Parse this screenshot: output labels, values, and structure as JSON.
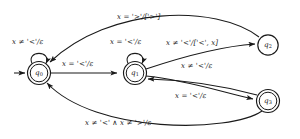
{
  "figure": {
    "kind": "finite-state-transducer-diagram",
    "background_color": "#ffffff",
    "stroke_color": "#1a1a1a",
    "width": 300,
    "height": 139
  },
  "states": [
    {
      "id": "q0",
      "label": "q",
      "subscript": "0",
      "accepting": true,
      "initial": true,
      "cx": 39,
      "cy": 73,
      "r_outer": 11.5,
      "r_inner": 8.8
    },
    {
      "id": "q1",
      "label": "q",
      "subscript": "1",
      "accepting": true,
      "initial": false,
      "cx": 135,
      "cy": 73,
      "r_outer": 11.5,
      "r_inner": 8.8
    },
    {
      "id": "q2",
      "label": "q",
      "subscript": "2",
      "accepting": false,
      "initial": false,
      "cx": 268,
      "cy": 45,
      "r_outer": 10.2,
      "r_inner": 0
    },
    {
      "id": "q3",
      "label": "q",
      "subscript": "3",
      "accepting": true,
      "initial": false,
      "cx": 268,
      "cy": 101,
      "r_outer": 11.5,
      "r_inner": 8.8
    }
  ],
  "transitions": [
    {
      "id": "t-q2-q0",
      "from": "q2",
      "to": "q0",
      "guard_var": "x",
      "guard_op": "=",
      "guard_value": "'>'",
      "output": "['>']",
      "label": "x = '>'/['>']",
      "label_x": 117,
      "label_y": 13
    },
    {
      "id": "t-q0-self",
      "from": "q0",
      "to": "q0",
      "guard_var": "x",
      "guard_op": "≠",
      "guard_value": "'<'",
      "output": "ε",
      "label": "x ≠ '<'/ε",
      "label_x": 12,
      "label_y": 38
    },
    {
      "id": "t-q0-q1",
      "from": "q0",
      "to": "q1",
      "guard_var": "x",
      "guard_op": "=",
      "guard_value": "'<'",
      "output": "ε",
      "label": "x = '<'/ε",
      "label_x": 62,
      "label_y": 60
    },
    {
      "id": "t-q1-self",
      "from": "q1",
      "to": "q1",
      "guard_var": "x",
      "guard_op": "=",
      "guard_value": "'<'",
      "output": "ε",
      "label": "x = '<'/ε",
      "label_x": 110,
      "label_y": 38
    },
    {
      "id": "t-q1-q2",
      "from": "q1",
      "to": "q2",
      "guard_var": "x",
      "guard_op": "≠",
      "guard_value": "'<'",
      "output": "['<', x]",
      "label": "x ≠ '<'/['<', x]",
      "label_x": 166,
      "label_y": 39
    },
    {
      "id": "t-q1-q3",
      "from": "q1",
      "to": "q3",
      "guard_var": "x",
      "guard_op": "≠",
      "guard_value": "'<'",
      "output": "ε",
      "label": "x ≠ '<'/ε",
      "label_x": 181,
      "label_y": 62
    },
    {
      "id": "t-q3-q1",
      "from": "q3",
      "to": "q1",
      "guard_var": "x",
      "guard_op": "=",
      "guard_value": "'<'",
      "output": "ε",
      "label": "x = '<'/ε",
      "label_x": 175,
      "label_y": 92
    },
    {
      "id": "t-q3-q0",
      "from": "q3",
      "to": "q0",
      "guard_var": "x",
      "guard_op": "≠",
      "guard_value": "'<' ∧ x ≠ '>'",
      "output": "ε",
      "label": "x ≠ '<' ∧ x ≠ '>'/ε",
      "label_x": 85,
      "label_y": 119
    }
  ]
}
